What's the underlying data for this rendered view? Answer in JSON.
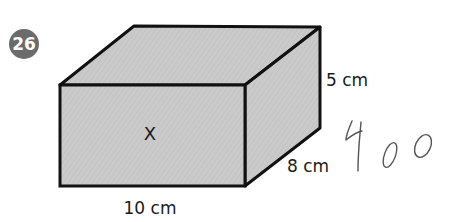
{
  "problem": {
    "number": "26",
    "badge_color": "#6b6b6b"
  },
  "figure": {
    "shape": "cuboid",
    "face_label": "X",
    "fill_color": "#c9c9c9",
    "edge_color": "#111111",
    "dimensions": {
      "length": "10 cm",
      "depth": "8 cm",
      "height": "5 cm"
    }
  },
  "handwritten_answer": "400"
}
